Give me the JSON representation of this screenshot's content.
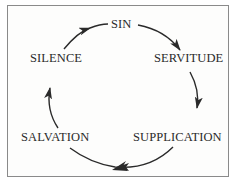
{
  "diagram": {
    "type": "cycle",
    "nodes": [
      {
        "id": "sin",
        "label": "SIN"
      },
      {
        "id": "servitude",
        "label": "SERVITUDE"
      },
      {
        "id": "supplication",
        "label": "SUPPLICATION"
      },
      {
        "id": "salvation",
        "label": "SALVATION"
      },
      {
        "id": "silence",
        "label": "SILENCE"
      }
    ],
    "edges": [
      {
        "from": "sin",
        "to": "servitude"
      },
      {
        "from": "servitude",
        "to": "supplication"
      },
      {
        "from": "supplication",
        "to": "salvation"
      },
      {
        "from": "salvation",
        "to": "silence"
      },
      {
        "from": "silence",
        "to": "sin"
      }
    ],
    "direction": "clockwise",
    "colors": {
      "stroke": "#2a2a2a",
      "border": "#8a8a8a",
      "background": "#fdfdfc"
    }
  }
}
